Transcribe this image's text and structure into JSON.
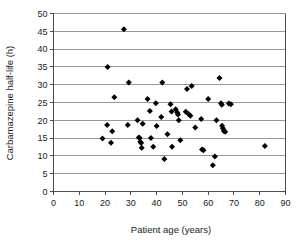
{
  "chart_data": {
    "type": "scatter",
    "title": "",
    "xlabel": "Patient age (years)",
    "ylabel": "Carbamazepine half-life (h)",
    "xlim": [
      0,
      90
    ],
    "ylim": [
      0,
      50
    ],
    "xticks": [
      0,
      10,
      20,
      30,
      40,
      50,
      60,
      70,
      80,
      90
    ],
    "yticks": [
      0,
      5,
      10,
      15,
      20,
      25,
      30,
      35,
      40,
      45,
      50
    ],
    "xtick_labels": [
      "0",
      "10",
      "20",
      "30",
      "40",
      "50",
      "60",
      "70",
      "80",
      "90"
    ],
    "ytick_labels": [
      "0",
      "5",
      "10",
      "15",
      "20",
      "25",
      "30",
      "35",
      "40",
      "45",
      "50"
    ],
    "grid": "horizontal",
    "legend": "none",
    "marker": "diamond",
    "marker_color": "#000000",
    "points": [
      {
        "x": 19.0,
        "y": 14.9
      },
      {
        "x": 20.8,
        "y": 18.7
      },
      {
        "x": 21.0,
        "y": 35.0
      },
      {
        "x": 22.3,
        "y": 13.7
      },
      {
        "x": 22.8,
        "y": 16.9
      },
      {
        "x": 23.6,
        "y": 26.5
      },
      {
        "x": 27.3,
        "y": 45.6
      },
      {
        "x": 28.8,
        "y": 18.7
      },
      {
        "x": 29.2,
        "y": 30.6
      },
      {
        "x": 32.6,
        "y": 20.0
      },
      {
        "x": 33.1,
        "y": 15.2
      },
      {
        "x": 33.4,
        "y": 15.0
      },
      {
        "x": 33.7,
        "y": 14.0
      },
      {
        "x": 34.0,
        "y": 13.6
      },
      {
        "x": 34.2,
        "y": 12.3
      },
      {
        "x": 34.6,
        "y": 19.0
      },
      {
        "x": 36.5,
        "y": 26.0
      },
      {
        "x": 37.4,
        "y": 22.6
      },
      {
        "x": 37.8,
        "y": 15.0
      },
      {
        "x": 38.7,
        "y": 12.6
      },
      {
        "x": 39.7,
        "y": 24.8
      },
      {
        "x": 40.0,
        "y": 18.4
      },
      {
        "x": 41.8,
        "y": 20.9
      },
      {
        "x": 42.2,
        "y": 30.6
      },
      {
        "x": 43.0,
        "y": 9.1
      },
      {
        "x": 44.2,
        "y": 16.1
      },
      {
        "x": 45.4,
        "y": 24.5
      },
      {
        "x": 45.8,
        "y": 22.5
      },
      {
        "x": 46.0,
        "y": 12.6
      },
      {
        "x": 47.4,
        "y": 23.1
      },
      {
        "x": 48.0,
        "y": 22.2
      },
      {
        "x": 48.3,
        "y": 21.6
      },
      {
        "x": 48.6,
        "y": 20.0
      },
      {
        "x": 49.2,
        "y": 14.4
      },
      {
        "x": 51.3,
        "y": 22.4
      },
      {
        "x": 51.8,
        "y": 28.8
      },
      {
        "x": 52.4,
        "y": 21.8
      },
      {
        "x": 53.1,
        "y": 21.3
      },
      {
        "x": 53.6,
        "y": 29.6
      },
      {
        "x": 55.0,
        "y": 18.0
      },
      {
        "x": 57.3,
        "y": 20.4
      },
      {
        "x": 57.6,
        "y": 11.8
      },
      {
        "x": 58.2,
        "y": 11.6
      },
      {
        "x": 60.0,
        "y": 26.0
      },
      {
        "x": 61.8,
        "y": 7.4
      },
      {
        "x": 62.6,
        "y": 9.8
      },
      {
        "x": 63.2,
        "y": 20.0
      },
      {
        "x": 64.4,
        "y": 31.9
      },
      {
        "x": 65.0,
        "y": 24.8
      },
      {
        "x": 65.3,
        "y": 24.4
      },
      {
        "x": 65.4,
        "y": 18.5
      },
      {
        "x": 65.7,
        "y": 17.8
      },
      {
        "x": 66.1,
        "y": 17.0
      },
      {
        "x": 66.6,
        "y": 16.8
      },
      {
        "x": 68.0,
        "y": 24.7
      },
      {
        "x": 68.8,
        "y": 24.5
      },
      {
        "x": 82.0,
        "y": 12.8
      }
    ]
  },
  "colors": {
    "marker": "#000000",
    "gridline": "#8c8c8c",
    "axis": "#4d4d4d",
    "text": "#1a1a1a",
    "background": "#ffffff"
  }
}
